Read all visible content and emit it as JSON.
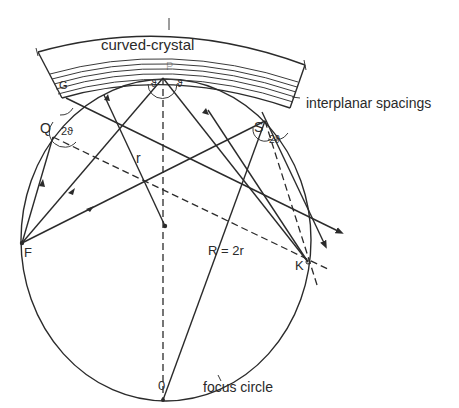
{
  "diagram": {
    "labels": {
      "crystal": "curved-crystal",
      "spacings": "interplanar spacings",
      "focus_circle": "focus circle",
      "radius_small": "r",
      "radius_large": "R = 2r",
      "point_P": "P",
      "point_Q": "Q",
      "point_S": "S",
      "point_F": "F",
      "point_K": "K",
      "point_O": "0",
      "point_G": "G",
      "angle_2theta_Q": "2ϑ",
      "angle_2theta_S": "2ϑ",
      "theta_left": "ϑ",
      "theta_right": "ϑ"
    },
    "colors": {
      "ink": "#2b2b2b",
      "background": "#ffffff"
    }
  }
}
